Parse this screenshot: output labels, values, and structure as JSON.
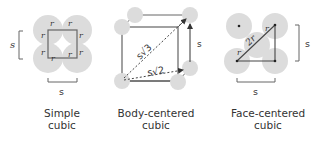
{
  "panels": [
    {
      "id": "simple-cubic",
      "caption_line1": "Simple",
      "caption_line2": "cubic",
      "dimension_label": "s",
      "radius_label": "r",
      "bottom_label": "s"
    },
    {
      "id": "body-centered-cubic",
      "caption_line1": "Body-centered",
      "caption_line2": "cubic",
      "dimension_label": "s",
      "body_diagonal_label": "s√3",
      "face_diagonal_label": "s√2"
    },
    {
      "id": "face-centered-cubic",
      "caption_line1": "Face-centered",
      "caption_line2": "cubic",
      "dimension_label": "s",
      "radius_label": "r",
      "diagonal_middle_label": "2r",
      "bottom_label": "s"
    }
  ],
  "colors": {
    "sphere": "#dcdcdc",
    "line": "#555555",
    "text": "#333333"
  }
}
